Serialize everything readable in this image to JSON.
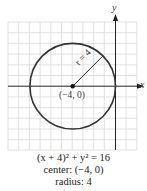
{
  "figure": {
    "axes": {
      "x_label": "x",
      "y_label": "y"
    },
    "grid": {
      "x_min": -10,
      "x_max": 2,
      "y_min": -6,
      "y_max": 6,
      "step": 1,
      "color": "#d6d6d6"
    },
    "circle": {
      "center": [
        -4,
        0
      ],
      "radius": 4,
      "color": "#333333"
    },
    "radius_label": "r = 4",
    "center_label": "(−4, 0)"
  },
  "caption": {
    "equation": "(x + 4)² + y² = 16",
    "center": "center: (−4, 0)",
    "radius": "radius: 4"
  }
}
